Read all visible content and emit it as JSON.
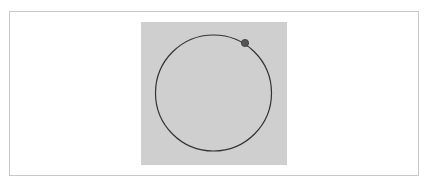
{
  "canvas": {
    "frame_border_color": "#c8c8c8",
    "stage_background": "#cfcfcf"
  },
  "orbit": {
    "circle": {
      "cx": 72.5,
      "cy": 71,
      "r": 58,
      "stroke": "#333333",
      "stroke_width": 1.2
    },
    "dot": {
      "cx": 104,
      "cy": 21,
      "r": 3.6,
      "fill": "#555555",
      "stroke": "#333333"
    }
  }
}
